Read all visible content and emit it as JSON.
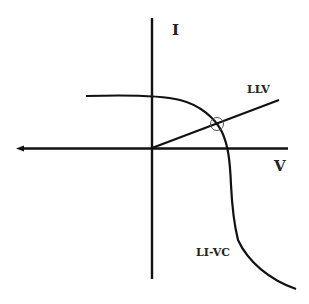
{
  "diagram": {
    "axes": {
      "y_label": "I",
      "x_label": "V"
    },
    "curves": [
      {
        "name": "LI-VC",
        "label": "LI-VC",
        "description": "current-voltage characteristic curve"
      },
      {
        "name": "LLV",
        "label": "LLV",
        "description": "load line from origin"
      }
    ],
    "operating_point": {
      "marker": "circle",
      "description": "intersection of LLV and LI-VC"
    },
    "colors": {
      "ink": "#111111",
      "background": "#ffffff"
    }
  }
}
